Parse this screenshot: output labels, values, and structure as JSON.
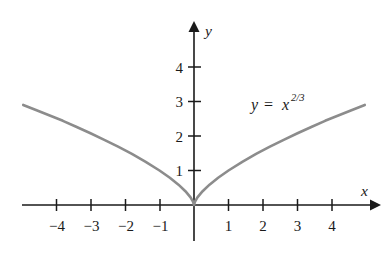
{
  "figure": {
    "kind": "cartesian-graph",
    "background_color": "#ffffff",
    "axis_color": "#1a1a1a",
    "curve_color": "#8c8c8c",
    "origin_px": {
      "x": 194,
      "y": 205
    },
    "unit_px": 34.5
  },
  "axes": {
    "x_label": "x",
    "y_label": "y",
    "x_ticks": [
      {
        "value": -4,
        "label": "−4"
      },
      {
        "value": -3,
        "label": "−3"
      },
      {
        "value": -2,
        "label": "−2"
      },
      {
        "value": -1,
        "label": "−1"
      },
      {
        "value": 1,
        "label": "1"
      },
      {
        "value": 2,
        "label": "2"
      },
      {
        "value": 3,
        "label": "3"
      },
      {
        "value": 4,
        "label": "4"
      }
    ],
    "y_ticks": [
      {
        "value": 1,
        "label": "1"
      },
      {
        "value": 2,
        "label": "2"
      },
      {
        "value": 3,
        "label": "3"
      },
      {
        "value": 4,
        "label": "4"
      }
    ]
  },
  "annotations": {
    "equation": {
      "lhs": "y",
      "operator": "=",
      "base": "x",
      "exponent": "2/3",
      "full_text": "y = x^(2/3)",
      "position_px": {
        "x": 251,
        "y": 104
      }
    }
  },
  "chart_data": {
    "type": "line",
    "title": "",
    "subtitle": "",
    "xlabel": "x",
    "ylabel": "y",
    "xlim": [
      -5.0,
      5.35
    ],
    "ylim": [
      -1.0,
      5.3
    ],
    "grid": false,
    "legend": null,
    "annotations": [
      "y = x^(2/3)"
    ],
    "xticks": [
      -4,
      -3,
      -2,
      -1,
      1,
      2,
      3,
      4
    ],
    "yticks": [
      1,
      2,
      3,
      4
    ],
    "series": [
      {
        "name": "y = x^(2/3)",
        "color": "#8c8c8c",
        "formula": "y = x**(2/3)",
        "x": [
          -4.95,
          -4.6,
          -4.2,
          -3.8,
          -3.4,
          -3.0,
          -2.6,
          -2.2,
          -1.8,
          -1.4,
          -1.0,
          -0.7,
          -0.45,
          -0.25,
          -0.1,
          -0.03,
          0,
          0.03,
          0.1,
          0.25,
          0.45,
          0.7,
          1.0,
          1.4,
          1.8,
          2.2,
          2.6,
          3.0,
          3.4,
          3.8,
          4.2,
          4.6,
          4.95
        ],
        "y": [
          2.9,
          2.76,
          2.6,
          2.44,
          2.26,
          2.08,
          1.89,
          1.69,
          1.48,
          1.25,
          1.0,
          0.79,
          0.59,
          0.4,
          0.22,
          0.1,
          0,
          0.1,
          0.22,
          0.4,
          0.59,
          0.79,
          1.0,
          1.25,
          1.48,
          1.69,
          1.89,
          2.08,
          2.26,
          2.44,
          2.6,
          2.76,
          2.9
        ]
      }
    ]
  }
}
